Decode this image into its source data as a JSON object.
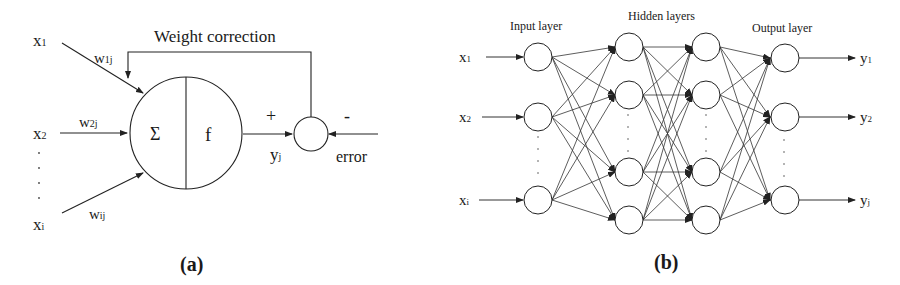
{
  "panel_a": {
    "caption": "(a)",
    "feedback_label": "Weight correction",
    "inputs": [
      {
        "name": "x",
        "sub": "1",
        "weight": "w",
        "weight_sub": "1j"
      },
      {
        "name": "x",
        "sub": "2",
        "weight": "w",
        "weight_sub": "2j"
      },
      {
        "name": "x",
        "sub": "i",
        "weight": "w",
        "weight_sub": "ij"
      }
    ],
    "neuron": {
      "sum_symbol": "Σ",
      "activation_symbol": "f"
    },
    "output": {
      "name": "y",
      "sub": "j"
    },
    "comparator": {
      "plus": "+",
      "minus": "-",
      "error_label": "error"
    }
  },
  "panel_b": {
    "caption": "(b)",
    "layer_labels": {
      "input": "Input layer",
      "hidden": "Hidden layers",
      "output": "Output layer"
    },
    "inputs": [
      {
        "name": "x",
        "sub": "1"
      },
      {
        "name": "x",
        "sub": "2"
      },
      {
        "name": "x",
        "sub": "i"
      }
    ],
    "outputs": [
      {
        "name": "y",
        "sub": "1"
      },
      {
        "name": "y",
        "sub": "2"
      },
      {
        "name": "y",
        "sub": "j"
      }
    ]
  }
}
